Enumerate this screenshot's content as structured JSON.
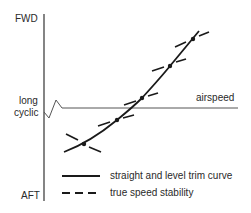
{
  "diagram": {
    "axis_labels": {
      "top": "FWD",
      "middle_line1": "long",
      "middle_line2": "cyclic",
      "bottom": "AFT",
      "horizontal": "airspeed"
    },
    "legend": [
      {
        "style": "solid",
        "label": "straight and level trim curve"
      },
      {
        "style": "dashed",
        "label": "true speed stability"
      }
    ],
    "colors": {
      "line": "#1a1a1a",
      "axis": "#333333",
      "baseline": "#555555",
      "text": "#2a2a2a"
    },
    "trim_curve_points": [
      [
        64,
        152
      ],
      [
        84,
        144
      ],
      [
        117,
        120
      ],
      [
        142,
        98
      ],
      [
        170,
        66
      ],
      [
        193,
        39
      ],
      [
        199,
        31
      ]
    ],
    "stability_markers": [
      {
        "x": 84,
        "y": 144,
        "slope_note": "tangent dash steeper negative (crossing curve)"
      },
      {
        "x": 117,
        "y": 120
      },
      {
        "x": 142,
        "y": 98
      },
      {
        "x": 170,
        "y": 66
      },
      {
        "x": 193,
        "y": 39
      }
    ]
  }
}
